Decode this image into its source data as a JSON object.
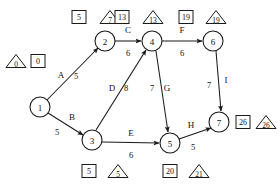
{
  "diagram": {
    "type": "activity-on-arrow-network",
    "nodes": [
      {
        "id": "1",
        "label": "1",
        "cx": 40,
        "cy": 107,
        "r": 10,
        "earliest": "0",
        "latest": "0",
        "box_x": 38,
        "box_y": 61,
        "tri_x": 16,
        "tri_y": 61
      },
      {
        "id": "2",
        "label": "2",
        "cx": 105,
        "cy": 41,
        "r": 10,
        "earliest": "5",
        "latest": "7",
        "box_x": 79,
        "box_y": 17,
        "tri_x": 110,
        "tri_y": 17
      },
      {
        "id": "3",
        "label": "3",
        "cx": 92,
        "cy": 140,
        "r": 10,
        "earliest": "5",
        "latest": "5",
        "box_x": 89,
        "box_y": 171,
        "tri_x": 118,
        "tri_y": 171
      },
      {
        "id": "4",
        "label": "4",
        "cx": 152,
        "cy": 41,
        "r": 10,
        "earliest": "13",
        "latest": "13",
        "box_x": 122,
        "box_y": 17,
        "tri_x": 153,
        "tri_y": 17
      },
      {
        "id": "5",
        "label": "5",
        "cx": 170,
        "cy": 143,
        "r": 10,
        "earliest": "20",
        "latest": "21",
        "box_x": 170,
        "box_y": 171,
        "tri_x": 199,
        "tri_y": 171
      },
      {
        "id": "6",
        "label": "6",
        "cx": 213,
        "cy": 41,
        "r": 10,
        "earliest": "19",
        "latest": "19",
        "box_x": 186,
        "box_y": 17,
        "tri_x": 216,
        "tri_y": 17
      },
      {
        "id": "7",
        "label": "7",
        "cx": 219,
        "cy": 122,
        "r": 10,
        "earliest": "26",
        "latest": "26",
        "box_x": 243,
        "box_y": 122,
        "tri_x": 266,
        "tri_y": 122
      }
    ],
    "edges": [
      {
        "name": "A",
        "weight": "5",
        "from": "1",
        "to": "2",
        "x1": 47,
        "y1": 100,
        "x2": 98,
        "y2": 48,
        "name_x": 61,
        "name_y": 75,
        "weight_x": 76,
        "weight_y": 76
      },
      {
        "name": "B",
        "weight": "5",
        "from": "1",
        "to": "3",
        "x1": 48,
        "y1": 113,
        "x2": 83,
        "y2": 135,
        "name_x": 72,
        "name_y": 117,
        "weight_x": 57,
        "weight_y": 132
      },
      {
        "name": "C",
        "weight": "6",
        "from": "2",
        "to": "4",
        "x1": 115,
        "y1": 41,
        "x2": 141,
        "y2": 41,
        "name_x": 128,
        "name_y": 30,
        "weight_x": 128,
        "weight_y": 53
      },
      {
        "name": "D",
        "weight": "8",
        "from": "3",
        "to": "4",
        "x1": 96,
        "y1": 130,
        "x2": 146,
        "y2": 50,
        "name_x": 112,
        "name_y": 88,
        "weight_x": 126,
        "weight_y": 88
      },
      {
        "name": "E",
        "weight": "6",
        "from": "3",
        "to": "5",
        "x1": 102,
        "y1": 142,
        "x2": 159,
        "y2": 143,
        "name_x": 131,
        "name_y": 133,
        "weight_x": 131,
        "weight_y": 155
      },
      {
        "name": "F",
        "weight": "6",
        "from": "4",
        "to": "6",
        "x1": 162,
        "y1": 41,
        "x2": 202,
        "y2": 41,
        "name_x": 182,
        "name_y": 30,
        "weight_x": 182,
        "weight_y": 53
      },
      {
        "name": "G",
        "weight": "7",
        "from": "4",
        "to": "5",
        "x1": 156,
        "y1": 51,
        "x2": 168,
        "y2": 132,
        "name_x": 167,
        "name_y": 88,
        "weight_x": 152,
        "weight_y": 88
      },
      {
        "name": "H",
        "weight": "5",
        "from": "5",
        "to": "7",
        "x1": 179,
        "y1": 139,
        "x2": 211,
        "y2": 128,
        "name_x": 191,
        "name_y": 125,
        "weight_x": 193,
        "weight_y": 147
      },
      {
        "name": "I",
        "weight": "7",
        "from": "6",
        "to": "7",
        "x1": 216,
        "y1": 51,
        "x2": 221,
        "y2": 111,
        "name_x": 226,
        "name_y": 80,
        "weight_x": 209,
        "weight_y": 85
      }
    ]
  }
}
